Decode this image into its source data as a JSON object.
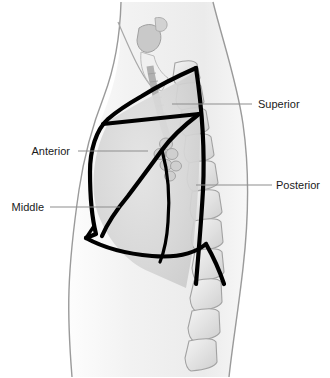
{
  "figure": {
    "background_color": "#ffffff"
  },
  "labels": [
    {
      "id": "superior",
      "text": "Superior",
      "anatomy": "superior lobe",
      "text_x": 258,
      "text_y": 108,
      "anchor": "start",
      "leader_x1": 172,
      "leader_y1": 104,
      "leader_x2": 252,
      "leader_y2": 104
    },
    {
      "id": "anterior",
      "text": "Anterior",
      "anatomy": "anterior segment",
      "text_x": 70,
      "text_y": 155,
      "anchor": "end",
      "leader_x1": 78,
      "leader_y1": 151,
      "leader_x2": 148,
      "leader_y2": 151
    },
    {
      "id": "middle",
      "text": "Middle",
      "anatomy": "middle lobe",
      "text_x": 44,
      "text_y": 211,
      "anchor": "end",
      "leader_x1": 50,
      "leader_y1": 207,
      "leader_x2": 120,
      "leader_y2": 207
    },
    {
      "id": "posterior",
      "text": "Posterior",
      "anatomy": "posterior lobe",
      "text_x": 276,
      "text_y": 189,
      "anchor": "start",
      "leader_x1": 196,
      "leader_y1": 185,
      "leader_x2": 272,
      "leader_y2": 185
    }
  ],
  "colors": {
    "outline": "#000000",
    "body_contour": "#9a9a9a",
    "leader": "#8d8d8d",
    "label_text": "#1a1a1a",
    "body_fill": "#f4f4f4",
    "lung_fill": "#dcdcdc",
    "bone_fill": "#e8e8e8"
  },
  "structures": [
    {
      "id": "body-outline",
      "name": "torso-contour"
    },
    {
      "id": "vertebral-column",
      "name": "thoracic-vertebrae",
      "count": 12
    },
    {
      "id": "trachea",
      "name": "trachea-airway"
    },
    {
      "id": "hilum",
      "name": "hilar-bronchi"
    },
    {
      "id": "diaphragm",
      "name": "diaphragm-border"
    },
    {
      "id": "oblique-fissure",
      "name": "oblique-fissure"
    },
    {
      "id": "horizontal-fissure",
      "name": "horizontal-fissure"
    }
  ]
}
